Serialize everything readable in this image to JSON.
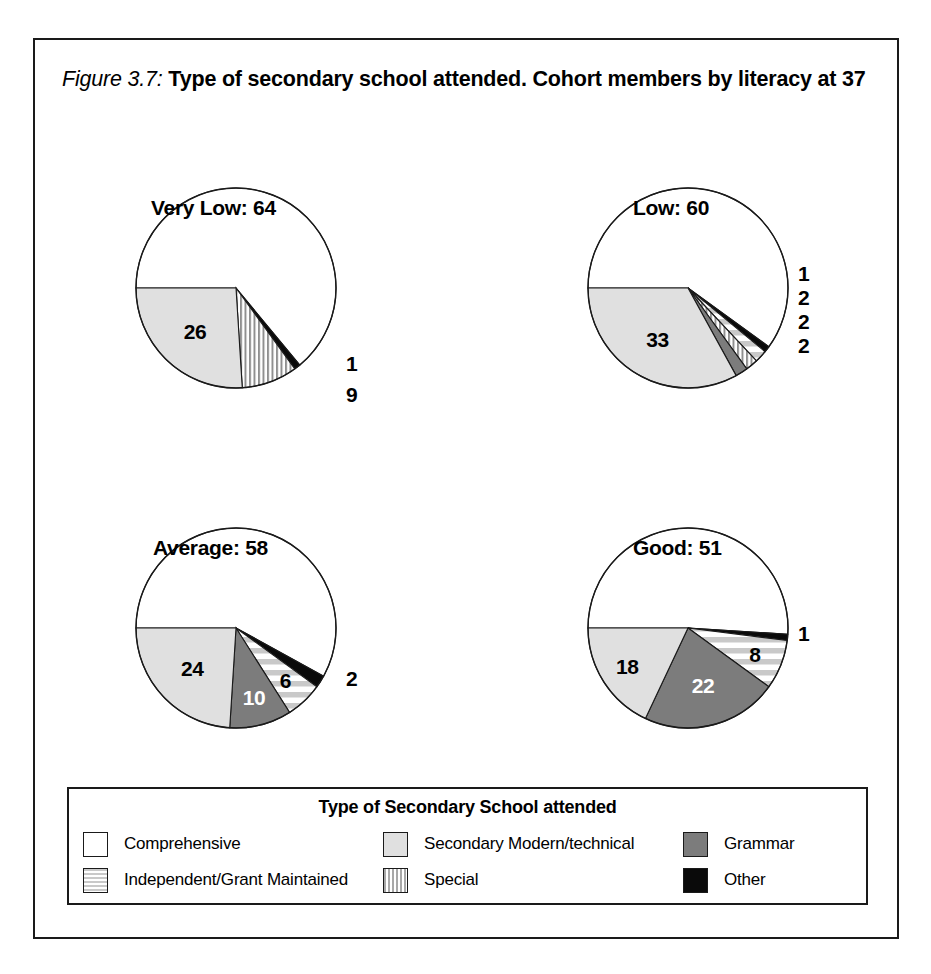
{
  "figure": {
    "number_label": "Figure 3.7:",
    "caption": "Type of secondary school attended. Cohort members by literacy at 37"
  },
  "legend": {
    "title": "Type of Secondary School attended",
    "items": [
      {
        "label": "Comprehensive",
        "pattern": "solid-white",
        "color": "#ffffff"
      },
      {
        "label": "Secondary Modern/technical",
        "pattern": "solid-light-gray",
        "color": "#e0e0e0"
      },
      {
        "label": "Grammar",
        "pattern": "solid-gray",
        "color": "#7c7c7c"
      },
      {
        "label": "Independent/Grant Maintained",
        "pattern": "horizontal-stripes",
        "color": "#c9c9c9"
      },
      {
        "label": "Special",
        "pattern": "vertical-stripes",
        "color": "#a8a8a8"
      },
      {
        "label": "Other",
        "pattern": "solid-black",
        "color": "#0a0a0a"
      }
    ]
  },
  "chart_data": {
    "type": "pie",
    "title": "Type of secondary school attended. Cohort members by literacy at 37",
    "categories": [
      "Comprehensive",
      "Other",
      "Independent/Grant Maintained",
      "Special",
      "Grammar",
      "Secondary Modern/technical"
    ],
    "value_unit": "percent",
    "legend_position": "bottom",
    "panels": [
      {
        "name": "Very Low",
        "heading": "Very Low: 64",
        "total_label": "64",
        "slices": [
          {
            "category": "Comprehensive",
            "value": 64,
            "label": "",
            "label_placement": "none"
          },
          {
            "category": "Other",
            "value": 1,
            "label": "1",
            "label_placement": "outside"
          },
          {
            "category": "Special",
            "value": 9,
            "label": "9",
            "label_placement": "outside"
          },
          {
            "category": "Secondary Modern/technical",
            "value": 26,
            "label": "26",
            "label_placement": "inside"
          }
        ]
      },
      {
        "name": "Low",
        "heading": "Low: 60",
        "total_label": "60",
        "slices": [
          {
            "category": "Comprehensive",
            "value": 60,
            "label": "",
            "label_placement": "none"
          },
          {
            "category": "Other",
            "value": 1,
            "label": "1",
            "label_placement": "outside"
          },
          {
            "category": "Independent/Grant Maintained",
            "value": 2,
            "label": "2",
            "label_placement": "outside"
          },
          {
            "category": "Special",
            "value": 2,
            "label": "2",
            "label_placement": "outside"
          },
          {
            "category": "Grammar",
            "value": 2,
            "label": "2",
            "label_placement": "outside"
          },
          {
            "category": "Secondary Modern/technical",
            "value": 33,
            "label": "33",
            "label_placement": "inside"
          }
        ]
      },
      {
        "name": "Average",
        "heading": "Average: 58",
        "total_label": "58",
        "slices": [
          {
            "category": "Comprehensive",
            "value": 58,
            "label": "",
            "label_placement": "none"
          },
          {
            "category": "Other",
            "value": 2,
            "label": "2",
            "label_placement": "outside"
          },
          {
            "category": "Independent/Grant Maintained",
            "value": 6,
            "label": "6",
            "label_placement": "inside"
          },
          {
            "category": "Grammar",
            "value": 10,
            "label": "10",
            "label_placement": "inside"
          },
          {
            "category": "Secondary Modern/technical",
            "value": 24,
            "label": "24",
            "label_placement": "inside"
          }
        ]
      },
      {
        "name": "Good",
        "heading": "Good: 51",
        "total_label": "51",
        "slices": [
          {
            "category": "Comprehensive",
            "value": 51,
            "label": "",
            "label_placement": "none"
          },
          {
            "category": "Other",
            "value": 1,
            "label": "1",
            "label_placement": "outside"
          },
          {
            "category": "Independent/Grant Maintained",
            "value": 8,
            "label": "8",
            "label_placement": "inside"
          },
          {
            "category": "Grammar",
            "value": 22,
            "label": "22",
            "label_placement": "inside"
          },
          {
            "category": "Secondary Modern/technical",
            "value": 18,
            "label": "18",
            "label_placement": "inside"
          }
        ]
      }
    ]
  }
}
